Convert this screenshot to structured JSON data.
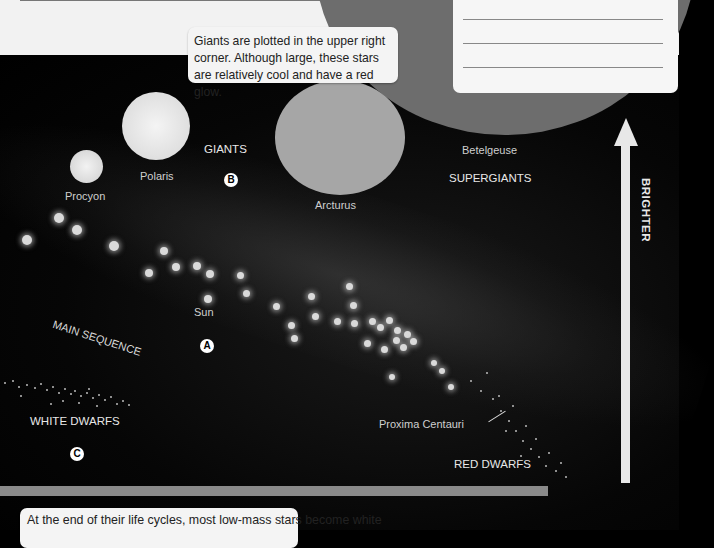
{
  "callouts": {
    "giants": "Giants are plotted in the upper right corner. Although large, these stars are relatively cool and have a red glow.",
    "white_dwarfs": "At the end of their life cycles, most low-mass stars become white"
  },
  "notes_box": {
    "lines": 3
  },
  "regions": {
    "giants": "GIANTS",
    "supergiants": "SUPERGIANTS",
    "main_sequence": "MAIN SEQUENCE",
    "white_dwarfs": "WHITE DWARFS",
    "red_dwarfs": "RED DWARFS"
  },
  "stars": {
    "procyon": "Procyon",
    "polaris": "Polaris",
    "arcturus": "Arcturus",
    "betelgeuse": "Betelgeuse",
    "sun": "Sun",
    "proxima": "Proxima Centauri"
  },
  "markers": {
    "a": "A",
    "b": "B",
    "c": "C"
  },
  "axis": {
    "brightness_label": "BRIGHTER"
  }
}
